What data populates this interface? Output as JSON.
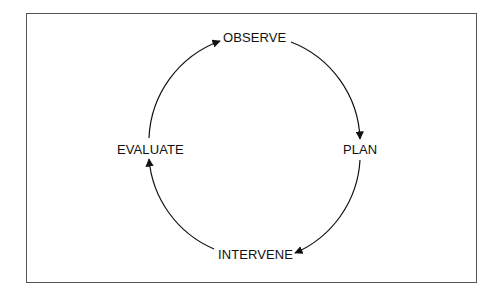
{
  "diagram": {
    "type": "cycle",
    "nodes": [
      {
        "id": "observe",
        "label": "OBSERVE"
      },
      {
        "id": "plan",
        "label": "PLAN"
      },
      {
        "id": "intervene",
        "label": "INTERVENE"
      },
      {
        "id": "evaluate",
        "label": "EVALUATE"
      }
    ],
    "edges": [
      {
        "from": "observe",
        "to": "plan"
      },
      {
        "from": "plan",
        "to": "intervene"
      },
      {
        "from": "intervene",
        "to": "evaluate"
      },
      {
        "from": "evaluate",
        "to": "observe"
      }
    ],
    "direction": "clockwise",
    "colors": {
      "stroke": "#111111",
      "frame": "#555555",
      "background": "#ffffff"
    }
  }
}
